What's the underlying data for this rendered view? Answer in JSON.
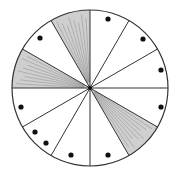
{
  "diagram": {
    "type": "fraction-circle",
    "center": [
      90,
      88
    ],
    "radius": 78,
    "sector_count": 12,
    "stroke_color": "#333333",
    "shade_color": "#a8a8a8",
    "shaded_sectors": [
      {
        "label": "sector-90-120",
        "start_deg": 90,
        "end_deg": 120
      },
      {
        "label": "sector-150-180",
        "start_deg": 150,
        "end_deg": 180
      },
      {
        "label": "sector-300-330",
        "start_deg": 300,
        "end_deg": 330
      }
    ],
    "dots": [
      {
        "x": 108,
        "y": 19
      },
      {
        "x": 143,
        "y": 39
      },
      {
        "x": 161,
        "y": 70
      },
      {
        "x": 161,
        "y": 107
      },
      {
        "x": 108,
        "y": 155
      },
      {
        "x": 71,
        "y": 155
      },
      {
        "x": 46,
        "y": 143
      },
      {
        "x": 35,
        "y": 132
      },
      {
        "x": 21,
        "y": 107
      },
      {
        "x": 40,
        "y": 38
      }
    ],
    "summary": {
      "total_sectors": 12,
      "shaded_count": 3,
      "dotted_count": 10
    }
  }
}
